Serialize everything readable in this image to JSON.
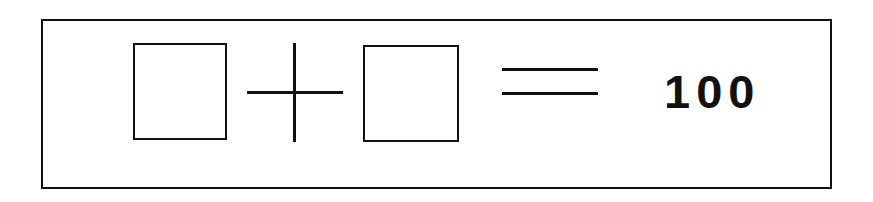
{
  "equation": {
    "operand1": "",
    "operator": "+",
    "operand2": "",
    "equals": "=",
    "result": "100"
  },
  "colors": {
    "stroke": "#111111",
    "background": "#ffffff"
  }
}
